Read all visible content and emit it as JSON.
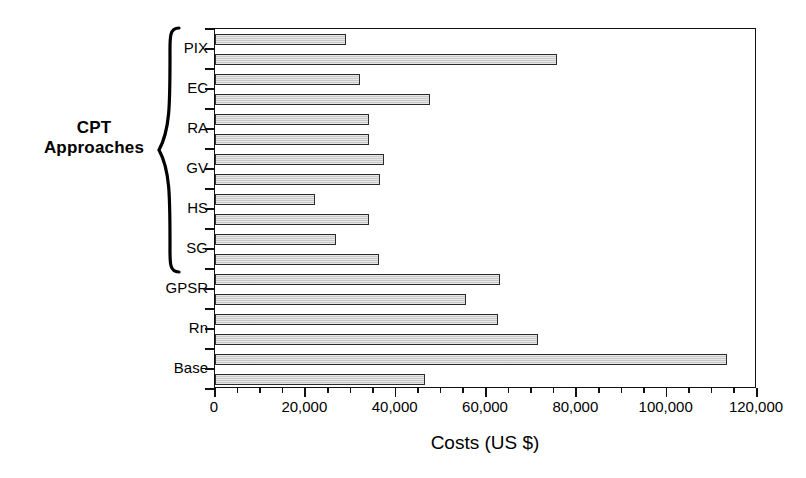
{
  "chart_data": {
    "type": "bar",
    "orientation": "horizontal",
    "title": "",
    "xlabel": "Costs (US $)",
    "ylabel": "",
    "xlim": [
      0,
      120000
    ],
    "grid": false,
    "legend": null,
    "xticks": [
      0,
      20000,
      40000,
      60000,
      80000,
      100000,
      120000
    ],
    "xticklabels": [
      "0",
      "20,000",
      "40,000",
      "60,000",
      "80,000",
      "100,000",
      "120,000"
    ],
    "minor_tick_step": 5000,
    "categories": [
      "PIX",
      "EC",
      "RA",
      "GV",
      "HS",
      "SG",
      "GPSR",
      "Rn",
      "Base"
    ],
    "bars_per_category": 2,
    "values": [
      [
        29000,
        75800
      ],
      [
        32000,
        47700
      ],
      [
        34000,
        34000
      ],
      [
        37500,
        36600
      ],
      [
        22200,
        34000
      ],
      [
        26800,
        36400
      ],
      [
        63000,
        55600
      ],
      [
        62700,
        71600
      ],
      [
        113300,
        46600
      ]
    ],
    "bar_fill_color": "#c9c9c9",
    "bar_edge_color": "#2b2b2b",
    "axis_color": "#111111",
    "background_color": "#ffffff"
  },
  "annotations": {
    "group_bracket_label": "CPT\nApproaches",
    "group_bracket_label_line1": "CPT",
    "group_bracket_label_line2": "Approaches",
    "group_bracket_categories": [
      "PIX",
      "EC",
      "RA",
      "GV",
      "HS",
      "SG"
    ]
  }
}
